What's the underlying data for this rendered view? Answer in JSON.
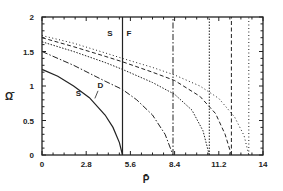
{
  "chart_data": {
    "type": "line",
    "title": "",
    "xlabel": "P̄",
    "ylabel": "Ω̄",
    "xlim": [
      0,
      14
    ],
    "ylim": [
      0,
      2
    ],
    "x_ticks": [
      "0",
      "2.8",
      "5.6",
      "8.4",
      "11.2",
      "14"
    ],
    "y_ticks": [
      "0",
      "0.5",
      "1",
      "1.5",
      "2"
    ],
    "grid": false,
    "legend": null,
    "annotations": [
      {
        "text": "S",
        "x": 2.3,
        "y": 0.85
      },
      {
        "text": "D",
        "x": 3.7,
        "y": 0.97
      },
      {
        "text": "S",
        "x": 4.3,
        "y": 1.72
      },
      {
        "text": "F",
        "x": 5.5,
        "y": 1.72
      }
    ],
    "series": [
      {
        "name": "solid",
        "style": "solid",
        "x": [
          0,
          1,
          2,
          3,
          4,
          4.5,
          4.9,
          5.1
        ],
        "y": [
          1.24,
          1.14,
          1.0,
          0.83,
          0.58,
          0.4,
          0.18,
          0.0
        ]
      },
      {
        "name": "solid-vertical",
        "style": "solid",
        "x": [
          5.1,
          5.1
        ],
        "y": [
          0,
          2
        ]
      },
      {
        "name": "dash-dot",
        "style": "dashdot",
        "x": [
          0,
          2,
          4,
          5.1,
          6,
          7,
          7.8,
          8.3
        ],
        "y": [
          1.5,
          1.3,
          1.07,
          0.95,
          0.8,
          0.58,
          0.3,
          0.0
        ]
      },
      {
        "name": "dash-dot-vertical",
        "style": "dashdot",
        "x": [
          8.3,
          8.3
        ],
        "y": [
          0,
          2
        ]
      },
      {
        "name": "dotted",
        "style": "dotted",
        "x": [
          0,
          2,
          4,
          5.1,
          7,
          8.4,
          9.5,
          10.2,
          10.6
        ],
        "y": [
          1.64,
          1.5,
          1.34,
          1.24,
          1.05,
          0.88,
          0.65,
          0.35,
          0.0
        ]
      },
      {
        "name": "dotted-vertical",
        "style": "dotted",
        "x": [
          10.6,
          10.6
        ],
        "y": [
          0,
          2
        ]
      },
      {
        "name": "dashed",
        "style": "dashed",
        "x": [
          0,
          2,
          4,
          5.1,
          7,
          8.4,
          10,
          11,
          11.6,
          12.0
        ],
        "y": [
          1.7,
          1.57,
          1.43,
          1.35,
          1.2,
          1.08,
          0.85,
          0.6,
          0.3,
          0.0
        ]
      },
      {
        "name": "dashed-vertical",
        "style": "dashed",
        "x": [
          12.0,
          12.0
        ],
        "y": [
          0,
          2
        ]
      },
      {
        "name": "fine-dotted",
        "style": "finedotted",
        "x": [
          0,
          2,
          4,
          5.1,
          7,
          8.4,
          10,
          11.2,
          12.2,
          12.8,
          13.1
        ],
        "y": [
          1.73,
          1.62,
          1.48,
          1.4,
          1.27,
          1.16,
          1.0,
          0.82,
          0.55,
          0.28,
          0.0
        ]
      },
      {
        "name": "fine-dotted-vertical",
        "style": "finedotted",
        "x": [
          13.1,
          13.1
        ],
        "y": [
          0,
          2
        ]
      }
    ]
  }
}
